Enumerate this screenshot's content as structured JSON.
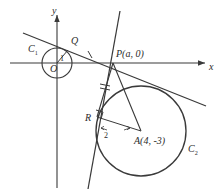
{
  "figure": {
    "axes": {
      "x_label": "x",
      "y_label": "y",
      "origin_label": "O"
    },
    "points": [
      {
        "name": "O",
        "label": "O",
        "x": 0,
        "y": 0,
        "px": 57,
        "py": 63
      },
      {
        "name": "Q",
        "label": "Q",
        "x": null,
        "y": null,
        "px": 68,
        "py": 50
      },
      {
        "name": "P",
        "label": "P(a, 0)",
        "x": "a",
        "y": 0,
        "px": 113,
        "py": 63
      },
      {
        "name": "R",
        "label": "R",
        "x": null,
        "y": null,
        "px": 97,
        "py": 116
      },
      {
        "name": "A",
        "label": "A(4, -3)",
        "x": 4,
        "y": -3,
        "px": 141,
        "py": 131
      }
    ],
    "circles": [
      {
        "name": "C1",
        "label": "C",
        "subscript": "1",
        "center_px": [
          57,
          63
        ],
        "radius_px": 15,
        "radius_label": "1"
      },
      {
        "name": "C2",
        "label": "C",
        "subscript": "2",
        "center_px": [
          141,
          131
        ],
        "radius_px": 45,
        "radius_label": "2"
      }
    ],
    "segments": [
      {
        "name": "radius-OQ",
        "from": "O",
        "to": "Q",
        "length_label": "1"
      },
      {
        "name": "radius-AR",
        "from": "A",
        "to": "R",
        "length_label": "2"
      },
      {
        "name": "tangent-PQ",
        "from": "P",
        "to": "Q",
        "tick_marks": 1
      },
      {
        "name": "tangent-PR",
        "from": "P",
        "to": "R",
        "tick_marks": 1
      },
      {
        "name": "segment-PA",
        "from": "P",
        "to": "A"
      }
    ],
    "right_angle_at": "R",
    "lines": [
      {
        "name": "tangent-line-shallow",
        "from_px": [
          23,
          33
        ],
        "to_px": [
          206,
          106
        ]
      },
      {
        "name": "tangent-line-steep",
        "from_px": [
          120,
          11
        ],
        "to_px": [
          88,
          189
        ]
      }
    ],
    "colors": {
      "stroke": "#3a3a3a",
      "label": "#2b2b2b",
      "background": "#ffffff"
    }
  }
}
